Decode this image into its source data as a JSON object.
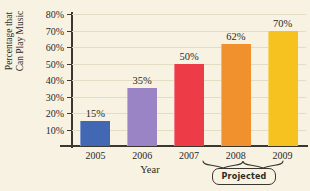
{
  "chart_data": {
    "type": "bar",
    "title": "",
    "xlabel": "Year",
    "ylabel_line1": "Percentage that",
    "ylabel_line2": "Can Play Music",
    "categories": [
      "2005",
      "2006",
      "2007",
      "2008",
      "2009"
    ],
    "values": [
      15,
      35,
      50,
      62,
      70
    ],
    "value_labels": [
      "15%",
      "35%",
      "50%",
      "62%",
      "70%"
    ],
    "ylim": [
      0,
      80
    ],
    "ytick_labels": [
      "10%",
      "20%",
      "30%",
      "40%",
      "50%",
      "60%",
      "70%",
      "80%"
    ],
    "ytick_values": [
      10,
      20,
      30,
      40,
      50,
      60,
      70,
      80
    ],
    "grid": true,
    "legend": "none",
    "series_colors": [
      "#4268b3",
      "#9b84c6",
      "#ee3b48",
      "#f0912e",
      "#f5c21f"
    ],
    "annotation": {
      "label": "Projected",
      "covers": [
        "2008",
        "2009"
      ]
    },
    "background_color": "#f7f2e2",
    "gridline_color": "#e3ddc6",
    "axis_color": "#3a3630"
  }
}
